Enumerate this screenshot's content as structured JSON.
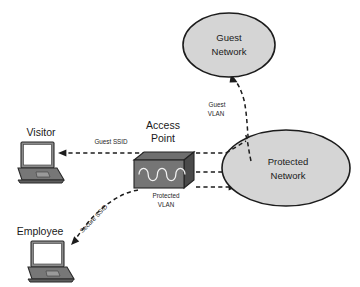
{
  "diagram": {
    "canvas": {
      "width": 360,
      "height": 287,
      "background": "#ffffff"
    },
    "palette": {
      "cloud_fill": "#d5d5d5",
      "cloud_stroke": "#1c1c1c",
      "line": "#1c1c1c",
      "device_body": "#757575",
      "device_screen": "#ffffff",
      "text": "#1a1a1a"
    },
    "nodes": [
      {
        "id": "guest-network",
        "type": "ellipse",
        "label_lines": [
          "Guest",
          "Network"
        ],
        "cx": 229,
        "cy": 45,
        "rx": 46,
        "ry": 32
      },
      {
        "id": "protected-network",
        "type": "ellipse",
        "label_lines": [
          "Protected",
          "Network"
        ],
        "cx": 286,
        "cy": 168,
        "rx": 64,
        "ry": 38
      },
      {
        "id": "access-point",
        "type": "device",
        "label_lines": [
          "Access",
          "Point"
        ],
        "x": 134,
        "y": 154,
        "width": 60,
        "height": 34
      },
      {
        "id": "visitor-laptop",
        "type": "laptop",
        "label": "Visitor",
        "x": 18,
        "y": 142,
        "width": 46,
        "height": 40
      },
      {
        "id": "employee-laptop",
        "type": "laptop",
        "label": "Employee",
        "x": 28,
        "y": 240,
        "width": 46,
        "height": 40
      }
    ],
    "links": [
      {
        "id": "guest-ssid",
        "from": "access-point",
        "to": "visitor-laptop",
        "label_lines": [
          "Guest SSID"
        ],
        "style": "dashed",
        "arrow": "end"
      },
      {
        "id": "secure-ssid",
        "from": "access-point",
        "to": "employee-laptop",
        "label_lines": [
          "Secure SSID"
        ],
        "style": "dashed",
        "arrow": "end",
        "rotation": -46
      },
      {
        "id": "ap-to-protected",
        "from": "access-point",
        "to": "protected-network",
        "label_lines": [],
        "style": "dashed",
        "arrow": "none"
      },
      {
        "id": "protected-vlan",
        "from": "access-point",
        "to": "protected-network",
        "label_lines": [
          "Protected",
          "VLAN"
        ],
        "style": "dashed",
        "arrow": "end"
      },
      {
        "id": "guest-vlan",
        "from": "protected-network",
        "to": "guest-network",
        "label_lines": [
          "Guest",
          "VLAN"
        ],
        "style": "dashed",
        "arrow": "end"
      }
    ],
    "labels": {
      "guest_network_line1": "Guest",
      "guest_network_line2": "Network",
      "protected_network_line1": "Protected",
      "protected_network_line2": "Network",
      "access_point_line1": "Access",
      "access_point_line2": "Point",
      "visitor": "Visitor",
      "employee": "Employee",
      "guest_ssid": "Guest SSID",
      "secure_ssid": "Secure SSID",
      "protected_vlan_line1": "Protected",
      "protected_vlan_line2": "VLAN",
      "guest_vlan_line1": "Guest",
      "guest_vlan_line2": "VLAN"
    }
  }
}
